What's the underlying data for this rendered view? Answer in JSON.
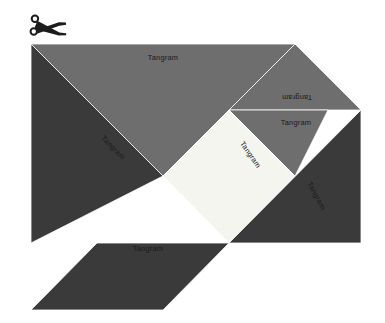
{
  "canvas": {
    "width": 385,
    "height": 323,
    "background": "#ffffff"
  },
  "figure": {
    "title": "Tangram"
  },
  "palette": {
    "dark": "#3a3a3a",
    "medium": "#6e6e6e",
    "light": "#f5f5f0",
    "outline": "#ffffff",
    "label": "#111111",
    "scissors": "#1c1c1c",
    "background": "#ffffff"
  },
  "icons": {
    "scissors": {
      "name": "scissors-icon",
      "x": 30,
      "y": 14
    }
  },
  "pieces": [
    {
      "id": "large-triangle-top",
      "shape": "triangle",
      "color": "#6e6e6e",
      "points": "31,44 295,44 163,176",
      "label": "Tangram",
      "label_x": 163,
      "label_y": 58,
      "label_rotation": 0
    },
    {
      "id": "large-triangle-left",
      "shape": "triangle",
      "color": "#3a3a3a",
      "points": "31,44 163,176 31,243",
      "label": "Tangram",
      "label_x": 113,
      "label_y": 148,
      "label_rotation": 45
    },
    {
      "id": "medium-triangle-right",
      "shape": "triangle",
      "color": "#6e6e6e",
      "points": "229,110 361,110 295,44",
      "label": "Tangram",
      "label_x": 297,
      "label_y": 97,
      "label_rotation": 180
    },
    {
      "id": "small-triangle-right",
      "shape": "triangle",
      "color": "#6e6e6e",
      "points": "229,110 328,110 295,176",
      "label": "Tangram",
      "label_x": 296,
      "label_y": 123,
      "label_rotation": 0
    },
    {
      "id": "square-center",
      "shape": "square",
      "color": "#f5f5f0",
      "points": "229,110 295,176 229,243 163,176",
      "label": "Tangram",
      "label_x": 250,
      "label_y": 155,
      "label_rotation": 55
    },
    {
      "id": "large-triangle-right",
      "shape": "triangle",
      "color": "#3a3a3a",
      "points": "361,110 361,243 229,243",
      "label": "Tangram",
      "label_x": 316,
      "label_y": 196,
      "label_rotation": 62
    },
    {
      "id": "parallelogram-bottom",
      "shape": "parallelogram",
      "color": "#3a3a3a",
      "points": "97,243 229,243 163,310 31,310",
      "label": "Tangram",
      "label_x": 148,
      "label_y": 249,
      "label_rotation": 0
    }
  ]
}
